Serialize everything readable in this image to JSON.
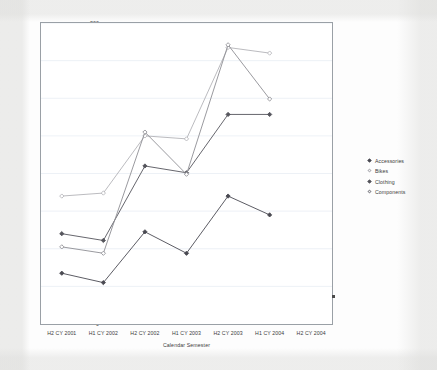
{
  "chart_data": {
    "type": "line",
    "title": "",
    "xlabel": "Calendar Semester",
    "ylabel": "",
    "categories": [
      "H2 CY 2001",
      "H1 CY 2002",
      "H2 CY 2002",
      "H1 CY 2003",
      "H2 CY 2003",
      "H1 CY 2004",
      "H2 CY 2004"
    ],
    "ylim": [
      0,
      800
    ],
    "yticks": [
      0,
      100,
      200,
      300,
      400,
      500,
      600,
      700,
      800
    ],
    "grid": true,
    "grid_axis": "y",
    "legend_position": "right",
    "markers": "diamond",
    "series": [
      {
        "name": "Accessories",
        "color": "#4a4a52",
        "values": [
          135,
          110,
          245,
          188,
          340,
          290,
          null
        ]
      },
      {
        "name": "Bikes",
        "color": "#b3b3b8",
        "values": [
          340,
          348,
          500,
          492,
          735,
          720,
          null
        ]
      },
      {
        "name": "Clothing",
        "color": "#55555c",
        "values": [
          240,
          222,
          420,
          402,
          557,
          557,
          null
        ]
      },
      {
        "name": "Components",
        "color": "#8e8e94",
        "values": [
          205,
          188,
          510,
          398,
          742,
          598,
          null
        ]
      }
    ]
  },
  "axes": {
    "y_tick_labels": [
      "800",
      "700",
      "600",
      "500",
      "400",
      "300",
      "200",
      "100",
      "0"
    ],
    "x_axis_title": "Calendar Semester"
  },
  "legend": {
    "entries": [
      {
        "label": "Accessories",
        "marker": "diamond-marker",
        "color": "#4a4a52"
      },
      {
        "label": "Bikes",
        "marker": "diamond-marker",
        "color": "#b3b3b8"
      },
      {
        "label": "Clothing",
        "marker": "diamond-marker",
        "color": "#55555c"
      },
      {
        "label": "Components",
        "marker": "diamond-marker",
        "color": "#8e8e94"
      }
    ]
  },
  "style": {
    "plot_border_color": "#9aa0a6",
    "gridline_color": "#e8eef4",
    "text_color": "#3b3b3b",
    "plot_background": "#ffffff"
  }
}
